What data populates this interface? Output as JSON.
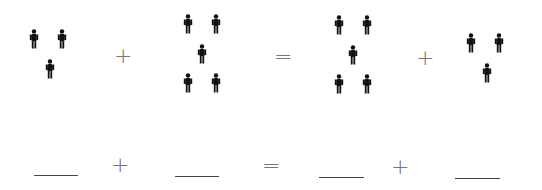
{
  "equation": {
    "groups": [
      {
        "count": 3,
        "icon": "person-icon"
      },
      {
        "count": 5,
        "icon": "person-icon"
      },
      {
        "count": 5,
        "icon": "person-icon"
      },
      {
        "count": 3,
        "icon": "person-icon"
      }
    ],
    "operators": [
      "+",
      "=",
      "+"
    ]
  },
  "answer_row": {
    "blanks": [
      "",
      "",
      "",
      ""
    ],
    "operators": [
      "+",
      "=",
      "+"
    ]
  }
}
